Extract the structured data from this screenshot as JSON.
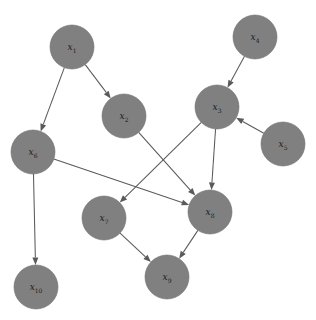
{
  "diagram": {
    "title": "",
    "type": "directed-acyclic-graph",
    "background_color": "#ffffff",
    "node_fill_color": "#808080",
    "node_stroke_color": "#6e6e6e",
    "edge_color": "#5a5a5a",
    "label_color": "#1a1a1a",
    "node_radius": 22,
    "nodes": [
      {
        "id": "x1",
        "base": "x",
        "sub": "1",
        "label": "x1",
        "cx": 72,
        "cy": 47
      },
      {
        "id": "x2",
        "base": "x",
        "sub": "2",
        "label": "x2",
        "cx": 124,
        "cy": 116
      },
      {
        "id": "x3",
        "base": "x",
        "sub": "3",
        "label": "x3",
        "cx": 217,
        "cy": 107
      },
      {
        "id": "x4",
        "base": "x",
        "sub": "4",
        "label": "x4",
        "cx": 255,
        "cy": 37
      },
      {
        "id": "x5",
        "base": "x",
        "sub": "5",
        "label": "x5",
        "cx": 283,
        "cy": 144
      },
      {
        "id": "x6",
        "base": "x",
        "sub": "6",
        "label": "x6",
        "cx": 33,
        "cy": 152
      },
      {
        "id": "x7",
        "base": "x",
        "sub": "7",
        "label": "x7",
        "cx": 104,
        "cy": 218
      },
      {
        "id": "x8",
        "base": "x",
        "sub": "8",
        "label": "x8",
        "cx": 210,
        "cy": 212
      },
      {
        "id": "x9",
        "base": "x",
        "sub": "9",
        "label": "x9",
        "cx": 167,
        "cy": 277
      },
      {
        "id": "x10",
        "base": "x",
        "sub": "10",
        "label": "x10",
        "cx": 36,
        "cy": 287
      }
    ],
    "edges": [
      {
        "from": "x1",
        "to": "x2"
      },
      {
        "from": "x1",
        "to": "x6"
      },
      {
        "from": "x4",
        "to": "x3"
      },
      {
        "from": "x5",
        "to": "x3"
      },
      {
        "from": "x2",
        "to": "x8"
      },
      {
        "from": "x3",
        "to": "x7"
      },
      {
        "from": "x3",
        "to": "x8"
      },
      {
        "from": "x6",
        "to": "x8"
      },
      {
        "from": "x6",
        "to": "x10"
      },
      {
        "from": "x7",
        "to": "x9"
      },
      {
        "from": "x8",
        "to": "x9"
      }
    ]
  }
}
